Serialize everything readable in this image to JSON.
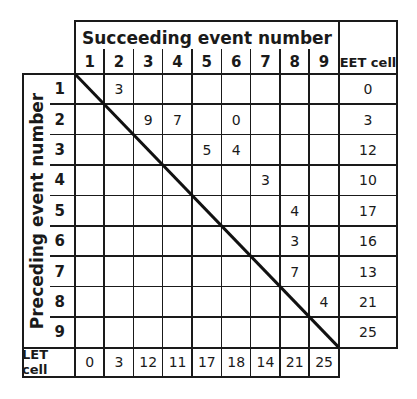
{
  "header": {
    "title": "Succeeding event number",
    "columns": [
      "1",
      "2",
      "3",
      "4",
      "5",
      "6",
      "7",
      "8",
      "9"
    ],
    "eet_label": "EET cell"
  },
  "side": {
    "title": "Preceding event number",
    "rows": [
      "1",
      "2",
      "3",
      "4",
      "5",
      "6",
      "7",
      "8",
      "9"
    ],
    "let_label": "LET cell"
  },
  "matrix": [
    [
      "",
      "3",
      "",
      "",
      "",
      "",
      "",
      "",
      ""
    ],
    [
      "",
      "",
      "9",
      "7",
      "",
      "0",
      "",
      "",
      ""
    ],
    [
      "",
      "",
      "",
      "",
      "5",
      "4",
      "",
      "",
      ""
    ],
    [
      "",
      "",
      "",
      "",
      "",
      "",
      "3",
      "",
      ""
    ],
    [
      "",
      "",
      "",
      "",
      "",
      "",
      "",
      "4",
      ""
    ],
    [
      "",
      "",
      "",
      "",
      "",
      "",
      "",
      "3",
      ""
    ],
    [
      "",
      "",
      "",
      "",
      "",
      "",
      "",
      "7",
      ""
    ],
    [
      "",
      "",
      "",
      "",
      "",
      "",
      "",
      "",
      "4"
    ],
    [
      "",
      "",
      "",
      "",
      "",
      "",
      "",
      "",
      ""
    ]
  ],
  "eet_values": [
    "0",
    "3",
    "12",
    "10",
    "17",
    "16",
    "13",
    "21",
    "25"
  ],
  "let_values": [
    "0",
    "3",
    "12",
    "11",
    "17",
    "18",
    "14",
    "21",
    "25"
  ],
  "colors": {
    "line": "#1a1a1a",
    "background": "#ffffff"
  }
}
